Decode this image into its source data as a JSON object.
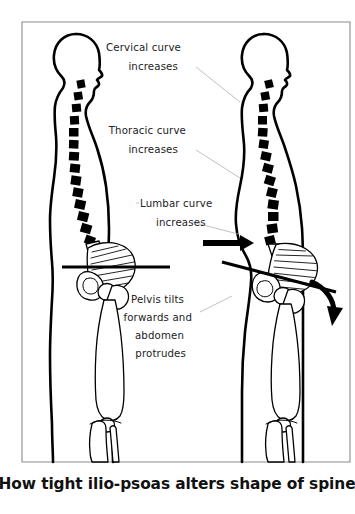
{
  "figure": {
    "title": "How tight ilio-psoas alters shape of spine",
    "background_color": "#ffffff",
    "ink_color": "#000000",
    "frame_color": "#8c8c8c",
    "leader_color": "#b0b0b0"
  },
  "caption": {
    "text": "How tight ilio-psoas alters shape of spine"
  },
  "annotations": [
    {
      "id": "cervical",
      "lines": [
        "Cervical curve",
        "increases"
      ],
      "line1": "Cervical curve",
      "line2": "increases"
    },
    {
      "id": "thoracic",
      "lines": [
        "Thoracic curve",
        "increases"
      ],
      "line1": "Thoracic curve",
      "line2": "increases"
    },
    {
      "id": "lumbar",
      "lines": [
        "Lumbar curve",
        "increases"
      ],
      "line1": "Lumbar curve",
      "line2": "increases"
    },
    {
      "id": "pelvis",
      "lines": [
        "Pelvis tilts",
        "forwards and",
        "abdomen",
        "protrudes"
      ],
      "line1": "Pelvis tilts",
      "line2": "forwards and",
      "line3": "abdomen",
      "line4": "protrudes"
    }
  ],
  "figures": [
    {
      "id": "left-figure",
      "role": "normal-posture",
      "pelvis_tilt_degrees": 0,
      "spine_vertebra_count": 17
    },
    {
      "id": "right-figure",
      "role": "tight-ilio-psoas-posture",
      "pelvis_tilt_degrees": 15,
      "spine_vertebra_count": 17
    }
  ],
  "arrows": [
    {
      "id": "forward-arrow",
      "direction": "right",
      "meaning": "abdomen protrudes forwards"
    },
    {
      "id": "tilt-arrow",
      "direction": "curved-down",
      "meaning": "pelvis tilts forwards"
    }
  ]
}
